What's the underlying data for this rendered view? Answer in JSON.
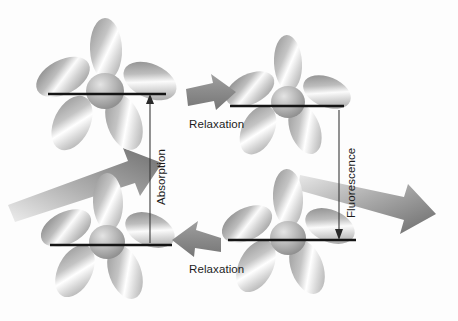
{
  "figure": {
    "background_color": "#fdfdfd",
    "ink_color": "#1c1c1c",
    "arrow_color_dark": "#7d7d7d",
    "arrow_color_light": "#c9c9c9",
    "lobe_color_dark": "#8a8a8a",
    "lobe_color_light": "#ffffff"
  },
  "labels": {
    "relaxation_top": "Relaxation",
    "relaxation_bottom": "Relaxation",
    "absorption": "Absorption",
    "fluorescence": "Fluorescence"
  },
  "icons": {
    "orbital_cluster": "orbital-lobe-cluster-icon",
    "block_arrow": "block-arrow-icon",
    "measure_arrow": "double-ended-measure-arrow-icon",
    "energy_level": "energy-level-line-icon"
  },
  "diagram": {
    "states": [
      {
        "name": "excited-state-left",
        "cx": 108,
        "cy": 92,
        "level_y": 94,
        "level_x1": 48,
        "level_x2": 166
      },
      {
        "name": "excited-state-right",
        "cx": 288,
        "cy": 104,
        "level_y": 106,
        "level_x1": 230,
        "level_x2": 344
      },
      {
        "name": "ground-state-left",
        "cx": 110,
        "cy": 243,
        "level_y": 245,
        "level_x1": 50,
        "level_x2": 172
      },
      {
        "name": "ground-state-right",
        "cx": 290,
        "cy": 238,
        "level_y": 240,
        "level_x1": 228,
        "level_x2": 356
      }
    ],
    "transitions": [
      {
        "name": "absorption-arrow",
        "label": "Absorption",
        "direction": "up",
        "x": 150,
        "y_from": 245,
        "y_to": 96
      },
      {
        "name": "fluorescence-arrow",
        "label": "Fluorescence",
        "direction": "down",
        "x": 339,
        "y_from": 108,
        "y_to": 238
      },
      {
        "name": "relaxation-top",
        "label": "Relaxation",
        "direction": "right",
        "from": "excited-state-left",
        "to": "excited-state-right"
      },
      {
        "name": "relaxation-bottom",
        "label": "Relaxation",
        "direction": "left",
        "from": "ground-state-right",
        "to": "ground-state-left"
      },
      {
        "name": "excitation-beam",
        "label": "",
        "direction": "up-right",
        "description": "incoming light beam"
      },
      {
        "name": "emission-beam",
        "label": "",
        "direction": "down-right",
        "description": "emitted light beam"
      }
    ]
  }
}
